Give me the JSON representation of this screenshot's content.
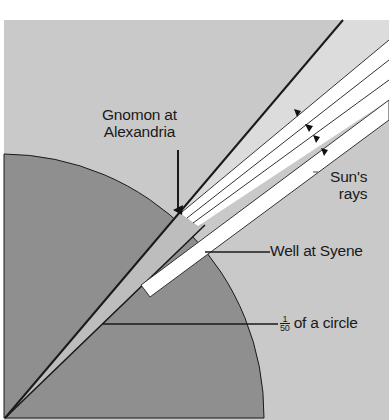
{
  "diagram": {
    "labels": {
      "gnomon": [
        "Gnomon at",
        "Alexandria"
      ],
      "sun_rays": [
        "Sun's",
        "rays"
      ],
      "well": "Well at Syene",
      "fraction_numerator": "1",
      "fraction_denominator": "50",
      "fraction_text": "of a circle"
    },
    "colors": {
      "background": "#c9c9c9",
      "earth": "#8f8f8f",
      "wedge": "#b8b8b8",
      "rays": "#ffffff",
      "lines": "#1a1a1a"
    }
  }
}
